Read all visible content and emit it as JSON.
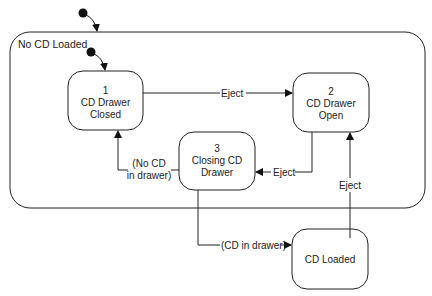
{
  "superstate": {
    "label": "No CD Loaded"
  },
  "states": [
    {
      "id": "1",
      "line1": "1",
      "line2": "CD Drawer",
      "line3": "Closed"
    },
    {
      "id": "2",
      "line1": "2",
      "line2": "CD Drawer",
      "line3": "Open"
    },
    {
      "id": "3",
      "line1": "3",
      "line2": "Closing CD",
      "line3": "Drawer"
    },
    {
      "id": "loaded",
      "line1": "CD Loaded"
    }
  ],
  "transitions": {
    "t1_to_2": "Eject",
    "t2_to_3": "Eject",
    "t3_to_1_line1": "(No CD",
    "t3_to_1_line2": "in drawer)",
    "t3_to_loaded": "(CD in drawer)",
    "loaded_to_2": "Eject"
  }
}
